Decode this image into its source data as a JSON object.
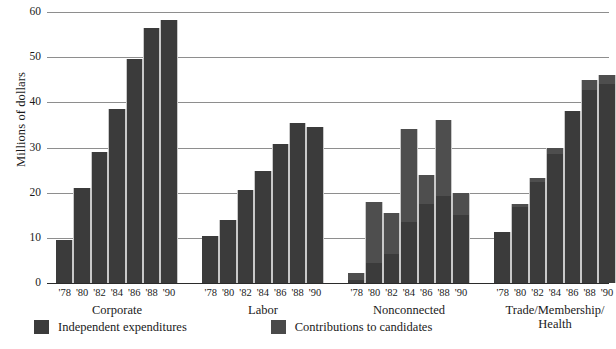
{
  "chart_data": {
    "type": "bar",
    "title": "",
    "xlabel": "",
    "ylabel": "Millions of dollars",
    "ylim": [
      0,
      60
    ],
    "yticks": [
      0,
      10,
      20,
      30,
      40,
      50,
      60
    ],
    "grid": true,
    "stacked": true,
    "legend_position": "bottom-left",
    "legend": [
      "Independent expenditures",
      "Contributions to candidates"
    ],
    "categories": [
      "'78",
      "'80",
      "'82",
      "'84",
      "'86",
      "'88",
      "'90"
    ],
    "groups": [
      {
        "name": "Corporate",
        "label_lines": [
          "Corporate"
        ],
        "series": [
          {
            "name": "Contributions to candidates",
            "values": [
              9.5,
              21.0,
              29.0,
              38.5,
              49.5,
              56.5,
              58.2
            ]
          },
          {
            "name": "Independent expenditures",
            "values": [
              0.0,
              0.0,
              0.0,
              0.0,
              0.0,
              0.0,
              0.0
            ]
          }
        ],
        "totals": [
          9.5,
          21.0,
          29.0,
          38.5,
          49.5,
          56.5,
          58.2
        ]
      },
      {
        "name": "Labor",
        "label_lines": [
          "Labor"
        ],
        "series": [
          {
            "name": "Contributions to candidates",
            "values": [
              10.3,
              14.0,
              20.7,
              24.8,
              30.7,
              35.5,
              34.6
            ]
          },
          {
            "name": "Independent expenditures",
            "values": [
              0.0,
              0.0,
              0.0,
              0.0,
              0.0,
              0.0,
              0.0
            ]
          }
        ],
        "totals": [
          10.3,
          14.0,
          20.7,
          24.8,
          30.7,
          35.5,
          34.6
        ]
      },
      {
        "name": "Nonconnected",
        "label_lines": [
          "Nonconnected"
        ],
        "series": [
          {
            "name": "Contributions to candidates",
            "values": [
              0.6,
              4.5,
              6.5,
              13.5,
              17.5,
              19.2,
              15.0
            ]
          },
          {
            "name": "Independent expenditures",
            "values": [
              1.7,
              13.5,
              9.0,
              20.5,
              6.5,
              16.8,
              5.0
            ]
          }
        ],
        "totals": [
          2.3,
          18.0,
          15.5,
          34.0,
          24.0,
          36.0,
          20.0
        ]
      },
      {
        "name": "Trade/Membership/Health",
        "label_lines": [
          "Trade/Membership/",
          "Health"
        ],
        "series": [
          {
            "name": "Contributions to candidates",
            "values": [
              11.2,
              16.8,
              22.4,
              28.5,
              38.0,
              42.7,
              44.1
            ]
          },
          {
            "name": "Independent expenditures",
            "values": [
              0.0,
              0.7,
              0.9,
              1.5,
              0.0,
              2.3,
              1.9
            ]
          }
        ],
        "totals": [
          11.2,
          17.5,
          23.3,
          30.0,
          38.0,
          45.0,
          46.0
        ]
      }
    ],
    "colors": {
      "contributions": "#3b3b3b",
      "independent": "#4e4e4e",
      "grid": "#8e8e8e",
      "axis": "#2b2b2b",
      "background": "#ffffff"
    }
  }
}
